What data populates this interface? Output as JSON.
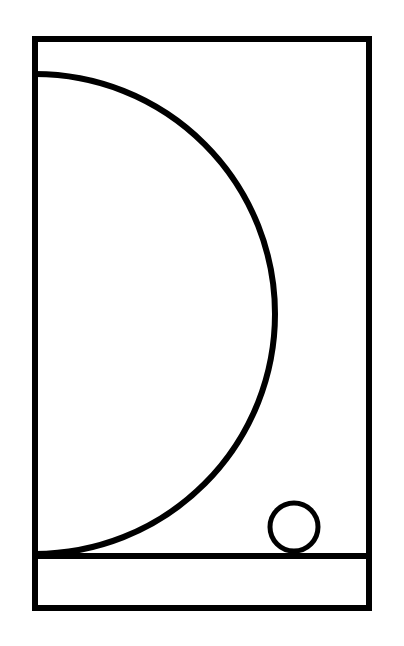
{
  "diagram": {
    "width": 404,
    "height": 646,
    "stroke_color": "#000000",
    "background": "#ffffff",
    "shapes": {
      "frame": {
        "x": 35,
        "y": 39,
        "width": 334,
        "height": 569,
        "stroke_width": 6
      },
      "ground_line": {
        "x1": 35,
        "y1": 556,
        "x2": 369,
        "y2": 556,
        "stroke_width": 6
      },
      "semicircle": {
        "cx": 35,
        "cy": 314,
        "r": 240,
        "stroke_width": 6
      },
      "ball": {
        "cx": 294,
        "cy": 527,
        "r": 24,
        "stroke_width": 5
      }
    }
  }
}
